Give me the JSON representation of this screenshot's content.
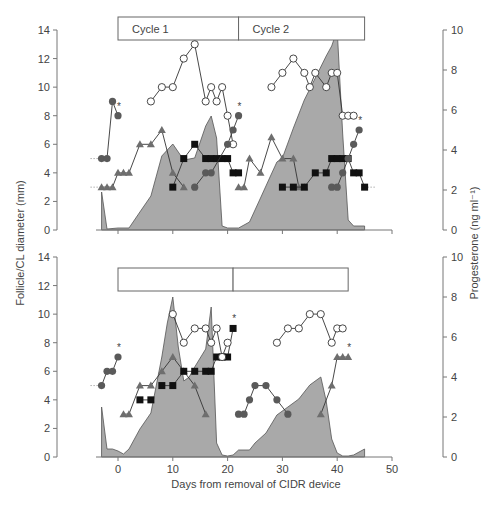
{
  "figure": {
    "left_axis_title": "Follicle/CL diameter (mm)",
    "right_axis_title": "Progesterone (ng ml⁻¹)",
    "x_axis_title": "Days from removal of CIDR device",
    "cycle_labels": [
      "Cycle 1",
      "Cycle 2"
    ],
    "colors": {
      "area_fill": "#a9a9a9",
      "area_stroke": "#555555",
      "line": "#333333",
      "filled_circle": "#5a5a5a",
      "square": "#111111",
      "triangle": "#6e6e6e",
      "open_circle_fill": "#ffffff",
      "axis": "#777777"
    }
  },
  "chart_data": [
    {
      "panel": "top",
      "type": "line",
      "title": "",
      "xlabel": "Days from removal of CIDR device",
      "ylabel": "Follicle/CL diameter (mm)",
      "y2label": "Progesterone (ng ml⁻¹)",
      "xlim": [
        -5,
        50
      ],
      "ylim": [
        0,
        14
      ],
      "y2lim": [
        0,
        10
      ],
      "xticks": [
        0,
        10,
        20,
        30,
        40,
        50
      ],
      "yticks": [
        0,
        2,
        4,
        6,
        8,
        10,
        12,
        14
      ],
      "y2ticks": [
        0,
        2,
        4,
        6,
        8,
        10
      ],
      "cycle_bar": [
        {
          "label": "Cycle 1",
          "from": 0,
          "to": 22
        },
        {
          "label": "Cycle 2",
          "from": 22,
          "to": 45
        }
      ],
      "progesterone_area": {
        "x": [
          -3,
          -2,
          0,
          2,
          4,
          6,
          8,
          10,
          12,
          14,
          16,
          17,
          18,
          19,
          20,
          22,
          24,
          26,
          28,
          29,
          30,
          32,
          34,
          36,
          38,
          39,
          40,
          41,
          42,
          43,
          45
        ],
        "y": [
          1.9,
          0.05,
          0.1,
          0.1,
          0.9,
          1.7,
          3.7,
          4.3,
          3.5,
          3.6,
          5.2,
          5.7,
          4.6,
          0.2,
          0.1,
          0.1,
          0.4,
          1.6,
          2.8,
          3.4,
          3.6,
          5.1,
          6.5,
          7.6,
          8.7,
          9.2,
          10.0,
          4.8,
          0.5,
          0.2,
          0.2
        ]
      },
      "series": [
        {
          "name": "Follicle A (filled circle, ovulated*)",
          "marker": "filled-circle",
          "x": [
            -3,
            -2,
            -1,
            0
          ],
          "y": [
            5,
            5,
            9,
            8
          ],
          "asterisk_at": 0
        },
        {
          "name": "Follicle B (triangle)",
          "marker": "triangle",
          "x": [
            -3,
            -2,
            -1,
            0,
            1,
            2,
            4,
            6,
            8,
            10,
            12
          ],
          "y": [
            3,
            3,
            3,
            4,
            4,
            4,
            6,
            6,
            7,
            4,
            3
          ]
        },
        {
          "name": "CL cycle 1 (open circle)",
          "marker": "open-circle",
          "x": [
            6,
            8,
            10,
            12,
            14,
            16,
            17,
            18,
            19,
            20,
            21
          ],
          "y": [
            9,
            10,
            10,
            12,
            13,
            9,
            10,
            9,
            10,
            8,
            6
          ]
        },
        {
          "name": "Follicle C (square)",
          "marker": "square",
          "x": [
            10,
            12,
            14,
            16,
            17,
            18,
            19,
            20,
            21,
            22
          ],
          "y": [
            3,
            5,
            6,
            5,
            5,
            5,
            5,
            5,
            4,
            4
          ]
        },
        {
          "name": "Follicle D (filled circle, ovulated*)",
          "marker": "filled-circle",
          "x": [
            14,
            16,
            17,
            20,
            21,
            22
          ],
          "y": [
            3,
            4,
            4,
            6,
            7,
            8
          ],
          "asterisk_at": 22
        },
        {
          "name": "Follicle E (triangle)",
          "marker": "triangle",
          "x": [
            22,
            23,
            24,
            26,
            28,
            30,
            32,
            33,
            34
          ],
          "y": [
            3,
            3,
            5,
            4,
            6.5,
            5,
            5,
            3,
            3
          ]
        },
        {
          "name": "CL cycle 2 (open circle)",
          "marker": "open-circle",
          "x": [
            28,
            30,
            32,
            34,
            35,
            36,
            38,
            39,
            40,
            41,
            42,
            43
          ],
          "y": [
            10,
            11,
            12,
            11,
            10,
            11,
            10,
            11,
            11,
            8,
            8,
            8
          ]
        },
        {
          "name": "Follicle F (square)",
          "marker": "square",
          "x": [
            30,
            32,
            34,
            36,
            38,
            39,
            40,
            41,
            42,
            43,
            44,
            45
          ],
          "y": [
            3,
            3,
            3,
            4,
            4,
            5,
            5,
            5,
            5,
            4,
            4,
            3
          ]
        },
        {
          "name": "Follicle G (filled circle, ovulated*)",
          "marker": "filled-circle",
          "x": [
            39,
            40,
            41,
            42,
            43,
            44
          ],
          "y": [
            3,
            3,
            4,
            5,
            6,
            7
          ],
          "asterisk_at": 44
        }
      ],
      "dotted_baselines": [
        {
          "y": 5,
          "x_from": -5,
          "x_to": -3
        },
        {
          "y": 3,
          "x_from": -5,
          "x_to": -3
        },
        {
          "y": 3,
          "x_from": 45,
          "x_to": 47
        }
      ]
    },
    {
      "panel": "bottom",
      "type": "line",
      "title": "",
      "xlabel": "Days from removal of CIDR device",
      "ylabel": "Follicle/CL diameter (mm)",
      "y2label": "Progesterone (ng ml⁻¹)",
      "xlim": [
        -5,
        50
      ],
      "ylim": [
        0,
        14
      ],
      "y2lim": [
        0,
        10
      ],
      "xticks": [
        0,
        10,
        20,
        30,
        40,
        50
      ],
      "xtick_labels": [
        "0",
        "10",
        "20",
        "30",
        "40",
        "50"
      ],
      "yticks": [
        0,
        2,
        4,
        6,
        8,
        10,
        12,
        14
      ],
      "y2ticks": [
        0,
        2,
        4,
        6,
        8,
        10
      ],
      "cycle_bar": [
        {
          "label": "",
          "from": 0,
          "to": 21
        },
        {
          "label": "",
          "from": 21,
          "to": 42
        }
      ],
      "progesterone_area": {
        "x": [
          -3,
          -2,
          -1,
          0,
          1,
          2,
          4,
          6,
          8,
          9,
          10,
          11,
          12,
          13,
          14,
          16,
          17,
          18,
          19,
          20,
          21,
          22,
          24,
          25,
          27,
          29,
          31,
          33,
          35,
          37,
          38,
          39,
          40,
          41,
          42,
          43,
          45
        ],
        "y": [
          2.5,
          0.4,
          0.4,
          0.3,
          0.15,
          0.4,
          1.4,
          2.2,
          5.0,
          6.7,
          8.0,
          5.5,
          3.8,
          4.0,
          4.5,
          5.4,
          7.5,
          0.7,
          0.1,
          0.05,
          0.1,
          0.35,
          0.35,
          0.7,
          1.2,
          2.1,
          2.5,
          2.9,
          3.6,
          4.0,
          2.8,
          0.9,
          0.2,
          0.05,
          0.05,
          0.1,
          0.4
        ]
      },
      "series": [
        {
          "name": "Follicle A (filled circle, ovulated*)",
          "marker": "filled-circle",
          "x": [
            -3,
            -2,
            -1,
            0
          ],
          "y": [
            5,
            6,
            6,
            7
          ],
          "asterisk_at": 0
        },
        {
          "name": "Follicle B (triangle)",
          "marker": "triangle",
          "x": [
            1,
            2,
            4,
            6,
            8,
            10,
            12,
            14,
            16
          ],
          "y": [
            3,
            3,
            5,
            5,
            6,
            7,
            6,
            5,
            3
          ]
        },
        {
          "name": "Follicle C (square)",
          "marker": "square",
          "x": [
            4,
            6
          ],
          "y": [
            4,
            4
          ]
        },
        {
          "name": "Follicle D (square, ovulated*)",
          "marker": "square",
          "x": [
            8,
            10,
            12,
            14,
            16,
            17,
            18,
            19,
            20,
            21
          ],
          "y": [
            5,
            5,
            6,
            6,
            6,
            6,
            7,
            7,
            7,
            9
          ],
          "asterisk_at": 21
        },
        {
          "name": "CL cycle 1 (open circle)",
          "marker": "open-circle",
          "x": [
            10,
            12,
            14,
            16,
            17,
            18,
            19,
            20
          ],
          "y": [
            10,
            8,
            9,
            9,
            8,
            9,
            7,
            8
          ]
        },
        {
          "name": "Follicle E (filled circle)",
          "marker": "filled-circle",
          "x": [
            22,
            23,
            24,
            25,
            27,
            29,
            31
          ],
          "y": [
            3,
            3,
            4,
            5,
            5,
            4,
            3
          ]
        },
        {
          "name": "CL cycle 2 (open circle)",
          "marker": "open-circle",
          "x": [
            29,
            31,
            33,
            35,
            37,
            39,
            40,
            41
          ],
          "y": [
            8,
            9,
            9,
            10,
            10,
            8,
            9,
            9
          ]
        },
        {
          "name": "Follicle F (triangle, ovulated*)",
          "marker": "triangle",
          "x": [
            37,
            39,
            40,
            41,
            42
          ],
          "y": [
            3,
            5,
            7,
            7,
            7
          ],
          "asterisk_at": 42
        }
      ],
      "dotted_baselines": [
        {
          "y": 5,
          "x_from": -5,
          "x_to": -3
        }
      ]
    }
  ]
}
